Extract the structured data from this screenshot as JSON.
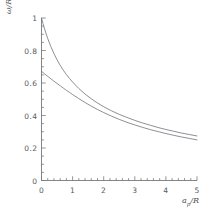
{
  "figure": {
    "background_color": "#ffffff",
    "line_color": "#6e7478",
    "axis_color": "#76797c",
    "text_color": "#555a5e"
  },
  "axes": {
    "y_label_main": "ω",
    "y_label_denom": "/R",
    "x_label_main": "a",
    "x_label_sub": "p",
    "x_label_denom": "/R",
    "x_ticks": [
      "0",
      "1",
      "2",
      "3",
      "4",
      "5"
    ],
    "y_ticks": [
      "0",
      "0.2",
      "0.4",
      "0.6",
      "0.8",
      "1"
    ]
  },
  "chart_data": {
    "type": "line",
    "title": "",
    "xlabel": "a_p/R",
    "ylabel": "ω/R",
    "xlim": [
      0,
      5
    ],
    "ylim": [
      0,
      1
    ],
    "grid": false,
    "legend": "none",
    "x_major_ticks": [
      0,
      1,
      2,
      3,
      4,
      5
    ],
    "y_major_ticks": [
      0,
      0.2,
      0.4,
      0.6,
      0.8,
      1
    ],
    "x_minor_tick_step": 0.2,
    "y_minor_tick_step": 0.05,
    "series": [
      {
        "name": "upper curve",
        "x": [
          0.0,
          0.05,
          0.1,
          0.15,
          0.2,
          0.3,
          0.4,
          0.5,
          0.6,
          0.7,
          0.8,
          0.9,
          1.0,
          1.2,
          1.4,
          1.6,
          1.8,
          2.0,
          2.25,
          2.5,
          2.75,
          3.0,
          3.25,
          3.5,
          3.75,
          4.0,
          4.25,
          4.5,
          4.75,
          5.0
        ],
        "y": [
          1.0,
          0.965,
          0.932,
          0.902,
          0.874,
          0.824,
          0.781,
          0.743,
          0.709,
          0.679,
          0.652,
          0.628,
          0.606,
          0.566,
          0.532,
          0.503,
          0.477,
          0.454,
          0.429,
          0.407,
          0.388,
          0.37,
          0.354,
          0.34,
          0.326,
          0.314,
          0.303,
          0.292,
          0.283,
          0.274
        ]
      },
      {
        "name": "lower curve",
        "x": [
          0.0,
          0.1,
          0.2,
          0.3,
          0.4,
          0.5,
          0.6,
          0.7,
          0.8,
          0.9,
          1.0,
          1.2,
          1.4,
          1.6,
          1.8,
          2.0,
          2.25,
          2.5,
          2.75,
          3.0,
          3.25,
          3.5,
          3.75,
          4.0,
          4.25,
          4.5,
          4.75,
          5.0
        ],
        "y": [
          0.672,
          0.656,
          0.641,
          0.626,
          0.611,
          0.597,
          0.583,
          0.569,
          0.555,
          0.542,
          0.529,
          0.504,
          0.48,
          0.458,
          0.437,
          0.418,
          0.396,
          0.376,
          0.358,
          0.342,
          0.327,
          0.313,
          0.301,
          0.289,
          0.278,
          0.268,
          0.259,
          0.25
        ]
      }
    ]
  }
}
